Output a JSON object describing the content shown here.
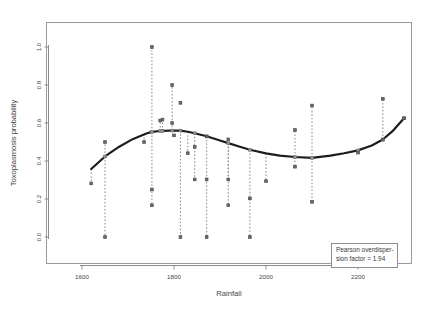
{
  "chart_data": {
    "type": "scatter",
    "title": "",
    "xlabel": "Rainfall",
    "ylabel": "Toxoplasmosis probability",
    "xlim": [
      1557,
      1855
    ],
    "ylim": [
      -0.13,
      1.13
    ],
    "xticks": [
      1600,
      1800,
      2000,
      2200
    ],
    "xtick_labels": [
      "1600",
      "1800",
      "2000",
      "2200"
    ],
    "yticks": [
      0.0,
      0.2,
      0.4,
      0.6,
      0.8,
      1.0
    ],
    "ytick_labels": [
      "0.0",
      "0.2",
      "0.4",
      "0.6",
      "0.8",
      "1.0"
    ],
    "grid": false,
    "legend_position": "bottom-right",
    "series": [
      {
        "name": "Observed proportion",
        "marker": "filled-square",
        "color": "#6b6b6b",
        "points": [
          {
            "x": 1620,
            "y": 0.282
          },
          {
            "x": 1650,
            "y": 0.5
          },
          {
            "x": 1650,
            "y": 0.0
          },
          {
            "x": 1735,
            "y": 0.5
          },
          {
            "x": 1752,
            "y": 1.0
          },
          {
            "x": 1752,
            "y": 0.25
          },
          {
            "x": 1752,
            "y": 0.167
          },
          {
            "x": 1770,
            "y": 0.613
          },
          {
            "x": 1775,
            "y": 0.618
          },
          {
            "x": 1796,
            "y": 0.8
          },
          {
            "x": 1796,
            "y": 0.6
          },
          {
            "x": 1800,
            "y": 0.535
          },
          {
            "x": 1814,
            "y": 0.706
          },
          {
            "x": 1814,
            "y": 0.0
          },
          {
            "x": 1830,
            "y": 0.441
          },
          {
            "x": 1845,
            "y": 0.474
          },
          {
            "x": 1845,
            "y": 0.303
          },
          {
            "x": 1871,
            "y": 0.529
          },
          {
            "x": 1871,
            "y": 0.303
          },
          {
            "x": 1871,
            "y": 0.0
          },
          {
            "x": 1918,
            "y": 0.514
          },
          {
            "x": 1918,
            "y": 0.303
          },
          {
            "x": 1918,
            "y": 0.167
          },
          {
            "x": 1965,
            "y": 0.203
          },
          {
            "x": 1965,
            "y": 0.0
          },
          {
            "x": 2000,
            "y": 0.294
          },
          {
            "x": 2063,
            "y": 0.563
          },
          {
            "x": 2063,
            "y": 0.37
          },
          {
            "x": 2100,
            "y": 0.692
          },
          {
            "x": 2100,
            "y": 0.185
          },
          {
            "x": 2200,
            "y": 0.444
          },
          {
            "x": 2254,
            "y": 0.727
          },
          {
            "x": 2254,
            "y": 0.513
          },
          {
            "x": 2300,
            "y": 0.625
          }
        ]
      },
      {
        "name": "Fitted values",
        "marker": "filled-square",
        "color": "#9b9b9b",
        "points": [
          {
            "x": 1650,
            "y": 0.424
          },
          {
            "x": 1752,
            "y": 0.553
          },
          {
            "x": 1770,
            "y": 0.558
          },
          {
            "x": 1775,
            "y": 0.558
          },
          {
            "x": 1796,
            "y": 0.56
          },
          {
            "x": 1814,
            "y": 0.56
          },
          {
            "x": 1845,
            "y": 0.546
          },
          {
            "x": 1871,
            "y": 0.53
          },
          {
            "x": 1918,
            "y": 0.494
          },
          {
            "x": 1965,
            "y": 0.459
          },
          {
            "x": 2063,
            "y": 0.421
          },
          {
            "x": 2100,
            "y": 0.416
          },
          {
            "x": 2200,
            "y": 0.456
          },
          {
            "x": 2254,
            "y": 0.513
          },
          {
            "x": 2300,
            "y": 0.625
          }
        ]
      }
    ],
    "fit_curve": {
      "name": "Smoothed fit (spline)",
      "color": "#1d1d1d",
      "points": [
        {
          "x": 1620,
          "y": 0.358
        },
        {
          "x": 1650,
          "y": 0.424
        },
        {
          "x": 1680,
          "y": 0.474
        },
        {
          "x": 1710,
          "y": 0.515
        },
        {
          "x": 1740,
          "y": 0.545
        },
        {
          "x": 1752,
          "y": 0.553
        },
        {
          "x": 1770,
          "y": 0.558
        },
        {
          "x": 1790,
          "y": 0.56
        },
        {
          "x": 1814,
          "y": 0.56
        },
        {
          "x": 1830,
          "y": 0.554
        },
        {
          "x": 1845,
          "y": 0.546
        },
        {
          "x": 1871,
          "y": 0.53
        },
        {
          "x": 1900,
          "y": 0.508
        },
        {
          "x": 1918,
          "y": 0.494
        },
        {
          "x": 1945,
          "y": 0.474
        },
        {
          "x": 1965,
          "y": 0.459
        },
        {
          "x": 2000,
          "y": 0.44
        },
        {
          "x": 2030,
          "y": 0.428
        },
        {
          "x": 2063,
          "y": 0.421
        },
        {
          "x": 2100,
          "y": 0.416
        },
        {
          "x": 2140,
          "y": 0.428
        },
        {
          "x": 2170,
          "y": 0.441
        },
        {
          "x": 2200,
          "y": 0.456
        },
        {
          "x": 2230,
          "y": 0.482
        },
        {
          "x": 2254,
          "y": 0.513
        },
        {
          "x": 2275,
          "y": 0.557
        },
        {
          "x": 2300,
          "y": 0.625
        }
      ]
    },
    "residual_lines": [
      {
        "x": 1620,
        "y0": 0.358,
        "y1": 0.282
      },
      {
        "x": 1650,
        "y0": 0.424,
        "y1": 0.5
      },
      {
        "x": 1650,
        "y0": 0.424,
        "y1": 0.0
      },
      {
        "x": 1735,
        "y0": 0.542,
        "y1": 0.5
      },
      {
        "x": 1752,
        "y0": 0.553,
        "y1": 1.0
      },
      {
        "x": 1752,
        "y0": 0.553,
        "y1": 0.167
      },
      {
        "x": 1770,
        "y0": 0.558,
        "y1": 0.613
      },
      {
        "x": 1775,
        "y0": 0.558,
        "y1": 0.618
      },
      {
        "x": 1796,
        "y0": 0.56,
        "y1": 0.8
      },
      {
        "x": 1800,
        "y0": 0.56,
        "y1": 0.535
      },
      {
        "x": 1814,
        "y0": 0.56,
        "y1": 0.0
      },
      {
        "x": 1830,
        "y0": 0.554,
        "y1": 0.441
      },
      {
        "x": 1845,
        "y0": 0.546,
        "y1": 0.303
      },
      {
        "x": 1871,
        "y0": 0.53,
        "y1": 0.0
      },
      {
        "x": 1918,
        "y0": 0.494,
        "y1": 0.303
      },
      {
        "x": 1918,
        "y0": 0.494,
        "y1": 0.167
      },
      {
        "x": 1965,
        "y0": 0.459,
        "y1": 0.0
      },
      {
        "x": 2000,
        "y0": 0.44,
        "y1": 0.294
      },
      {
        "x": 2063,
        "y0": 0.421,
        "y1": 0.563
      },
      {
        "x": 2063,
        "y0": 0.421,
        "y1": 0.37
      },
      {
        "x": 2100,
        "y0": 0.416,
        "y1": 0.692
      },
      {
        "x": 2100,
        "y0": 0.416,
        "y1": 0.185
      },
      {
        "x": 2200,
        "y0": 0.456,
        "y1": 0.444
      },
      {
        "x": 2254,
        "y0": 0.513,
        "y1": 0.727
      }
    ]
  },
  "legend": {
    "line1": "Pearson overdisper-",
    "line2": "sion factor = 1.94"
  },
  "axes": {
    "x_title": "Rainfall",
    "y_title": "Toxoplasmosis probability"
  }
}
